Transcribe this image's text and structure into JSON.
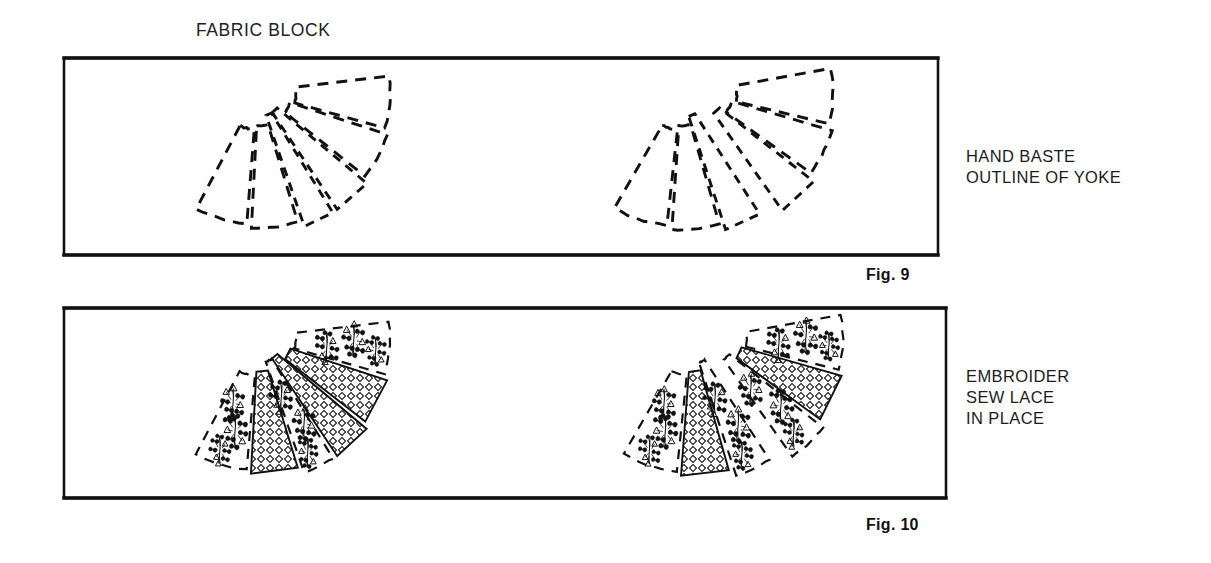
{
  "page": {
    "background": "#ffffff",
    "ink": "#111111",
    "title_note": "Sewing instruction diagram: yoke construction"
  },
  "captions": {
    "fabric_block": "FABRIC BLOCK",
    "hand_baste": "HAND BASTE\nOUTLINE OF YOKE",
    "embroider": "EMBROIDER\nSEW LACE\nIN PLACE"
  },
  "figures": [
    {
      "id": "fig9",
      "number": "Fig. 9",
      "frame": {
        "x": 64,
        "y": 58,
        "w": 874,
        "h": 197
      }
    },
    {
      "id": "fig10",
      "number": "Fig. 10",
      "frame": {
        "x": 64,
        "y": 308,
        "w": 882,
        "h": 190
      }
    }
  ],
  "lace_band_label": "lace-band",
  "embroidery_label": "embroidery-spray",
  "yokes": [
    {
      "name": "fig9-yoke-front",
      "figure": "fig9",
      "style": "dashed",
      "center": {
        "x": 258,
        "y": 92
      },
      "split": false,
      "panels": [
        {
          "a0": -118,
          "a1": -95,
          "r0": 38,
          "r1": 132
        },
        {
          "a0": -93,
          "a1": -73,
          "r0": 34,
          "r1": 136
        },
        {
          "a0": -71,
          "a1": -58,
          "r0": 25,
          "r1": 142
        },
        {
          "a0": -56,
          "a1": -40,
          "r0": 25,
          "r1": 142
        },
        {
          "a0": -38,
          "a1": -18,
          "r0": 34,
          "r1": 136
        },
        {
          "a0": -16,
          "a1": 7,
          "r0": 38,
          "r1": 132
        }
      ]
    },
    {
      "name": "fig9-yoke-back",
      "figure": "fig9",
      "style": "dashed",
      "center": {
        "x": 690,
        "y": 92
      },
      "split": true,
      "panels": [
        {
          "a0": -120,
          "a1": -96,
          "r0": 38,
          "r1": 134
        },
        {
          "a0": -94,
          "a1": -74,
          "r0": 34,
          "r1": 138
        },
        {
          "a0": -72,
          "a1": -57,
          "r0": 26,
          "r1": 145
        },
        {
          "a0": -55,
          "a1": -38,
          "r0": 26,
          "r1": 145
        },
        {
          "a0": -36,
          "a1": -16,
          "r0": 34,
          "r1": 138
        },
        {
          "a0": -14,
          "a1": 10,
          "r0": 38,
          "r1": 134
        }
      ]
    },
    {
      "name": "fig10-yoke-front",
      "figure": "fig10",
      "style": "embroidered",
      "center": {
        "x": 258,
        "y": 338
      },
      "split": false,
      "panels": [
        {
          "a0": -118,
          "a1": -95,
          "r0": 38,
          "r1": 132,
          "fill": "embroidery"
        },
        {
          "a0": -93,
          "a1": -73,
          "r0": 34,
          "r1": 136,
          "fill": "lace"
        },
        {
          "a0": -71,
          "a1": -58,
          "r0": 25,
          "r1": 142,
          "fill": "embroidery"
        },
        {
          "a0": -56,
          "a1": -40,
          "r0": 25,
          "r1": 142,
          "fill": "lace-center"
        },
        {
          "a0": -38,
          "a1": -18,
          "r0": 34,
          "r1": 136,
          "fill": "lace"
        },
        {
          "a0": -16,
          "a1": 7,
          "r0": 38,
          "r1": 132,
          "fill": "embroidery"
        }
      ]
    },
    {
      "name": "fig10-yoke-back",
      "figure": "fig10",
      "style": "embroidered",
      "center": {
        "x": 700,
        "y": 338
      },
      "split": true,
      "panels": [
        {
          "a0": -120,
          "a1": -96,
          "r0": 38,
          "r1": 134,
          "fill": "embroidery"
        },
        {
          "a0": -94,
          "a1": -74,
          "r0": 34,
          "r1": 138,
          "fill": "lace"
        },
        {
          "a0": -72,
          "a1": -57,
          "r0": 26,
          "r1": 145,
          "fill": "embroidery"
        },
        {
          "a0": -55,
          "a1": -38,
          "r0": 26,
          "r1": 145,
          "fill": "embroidery"
        },
        {
          "a0": -36,
          "a1": -16,
          "r0": 34,
          "r1": 138,
          "fill": "lace"
        },
        {
          "a0": -14,
          "a1": 10,
          "r0": 38,
          "r1": 134,
          "fill": "embroidery"
        }
      ]
    }
  ]
}
